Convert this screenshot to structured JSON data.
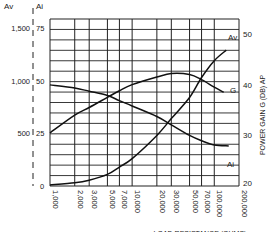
{
  "chart_data": {
    "type": "line",
    "title": "",
    "xlabel": "LOAD RESISTANCE (OHMS)",
    "xscale": "log",
    "x_ticks": [
      1000,
      2000,
      3000,
      5000,
      7000,
      10000,
      20000,
      30000,
      50000,
      70000,
      100000,
      200000
    ],
    "x_tick_labels": [
      "1,000",
      "2,000",
      "3,000",
      "5,000",
      "7,000",
      "10,000",
      "20,000",
      "30,000",
      "50,000",
      "70,000",
      "100,000",
      "200,000"
    ],
    "left_axes": [
      {
        "label": "Av",
        "ticks": [
          0,
          500,
          1000,
          1500
        ],
        "tick_labels": [
          "0",
          "500",
          "1,000",
          "1,500"
        ],
        "ylim": [
          0,
          1500
        ]
      },
      {
        "label": "Ai",
        "ticks": [
          0,
          25,
          50,
          75
        ],
        "tick_labels": [
          "0",
          "25",
          "50",
          "75"
        ],
        "ylim": [
          0,
          75
        ]
      }
    ],
    "right_axis": {
      "label": "POWER GAIN G (DB) AP",
      "ticks": [
        20,
        30,
        40,
        50
      ],
      "tick_labels": [
        "20",
        "30",
        "40",
        "50"
      ],
      "ylim": [
        20,
        52
      ]
    },
    "grid": true,
    "series": [
      {
        "name": "Av",
        "axis": "Av",
        "x": [
          1000,
          2000,
          3000,
          5000,
          7000,
          10000,
          20000,
          30000,
          50000,
          70000,
          100000,
          140000
        ],
        "values": [
          10,
          30,
          55,
          110,
          180,
          260,
          480,
          640,
          840,
          1030,
          1190,
          1290
        ]
      },
      {
        "name": "Ai",
        "axis": "Ai",
        "x": [
          1000,
          2000,
          3000,
          5000,
          7000,
          10000,
          20000,
          30000,
          50000,
          70000,
          100000,
          150000
        ],
        "values": [
          48,
          46.5,
          45,
          43,
          40.5,
          38,
          33,
          29,
          24,
          21.5,
          19.5,
          19
        ]
      },
      {
        "name": "G",
        "axis": "right",
        "x": [
          1000,
          2000,
          3000,
          5000,
          7000,
          10000,
          20000,
          30000,
          50000,
          70000,
          100000,
          130000
        ],
        "values": [
          30.5,
          34,
          35.5,
          37.5,
          38.8,
          40,
          41.5,
          42.2,
          42,
          41,
          39.5,
          38.5
        ]
      }
    ],
    "curve_labels": [
      "Av",
      "G",
      "Ai"
    ]
  },
  "labels": {
    "av_axis": "Av",
    "ai_axis": "Ai",
    "right_axis": "POWER GAIN G (DB) AP",
    "x_axis": "LOAD RESISTANCE (OHMS)",
    "curve_av": "Av",
    "curve_g": "G",
    "curve_ai": "Ai"
  }
}
